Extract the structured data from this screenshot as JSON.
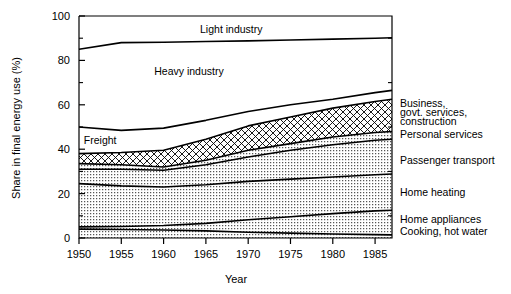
{
  "chart_data": {
    "type": "area",
    "title": "",
    "xlabel": "Year",
    "ylabel": "Share in final energy use (%)",
    "xlim": [
      1950,
      1987
    ],
    "ylim": [
      0,
      100
    ],
    "grid": false,
    "legend_position": "inline-right",
    "stacked": true,
    "x": [
      1950,
      1955,
      1960,
      1965,
      1970,
      1975,
      1980,
      1985,
      1987
    ],
    "xticks": [
      1950,
      1955,
      1960,
      1965,
      1970,
      1975,
      1980,
      1985
    ],
    "xticklabels": [
      "1950",
      "1955",
      "1960",
      "1965",
      "1970",
      "1975",
      "1980",
      "1985"
    ],
    "yticks": [
      0,
      20,
      40,
      60,
      80,
      100
    ],
    "yticklabels": [
      "0",
      "20",
      "40",
      "60",
      "80",
      "100"
    ],
    "yminorticks": [
      10,
      30,
      50,
      70,
      90
    ],
    "series": [
      {
        "name": "Cooking, hot water",
        "fill": "dots",
        "cumulative": [
          4.0,
          3.8,
          3.6,
          3.2,
          2.6,
          2.2,
          1.8,
          1.5,
          1.4
        ]
      },
      {
        "name": "Home appliances",
        "fill": "dots",
        "cumulative": [
          5.0,
          5.2,
          5.6,
          6.6,
          8.2,
          9.6,
          11.0,
          12.2,
          12.5
        ]
      },
      {
        "name": "Home heating",
        "fill": "dots",
        "cumulative": [
          24.5,
          23.5,
          23.0,
          24.0,
          25.5,
          26.5,
          27.5,
          28.5,
          28.8
        ]
      },
      {
        "name": "Passenger transport",
        "fill": "dots",
        "cumulative": [
          31.0,
          31.0,
          30.5,
          33.0,
          36.5,
          39.5,
          42.0,
          44.0,
          44.5
        ]
      },
      {
        "name": "Personal services",
        "fill": "dots",
        "cumulative": [
          33.5,
          33.0,
          32.0,
          35.0,
          39.5,
          42.5,
          45.5,
          47.5,
          48.0
        ]
      },
      {
        "name": "Business, govt. services, construction",
        "fill": "crosshatch",
        "cumulative": [
          38.0,
          38.5,
          39.5,
          44.5,
          50.5,
          54.5,
          58.5,
          61.5,
          62.5
        ]
      },
      {
        "name": "Freight",
        "fill": "none",
        "cumulative": [
          50.0,
          48.5,
          49.5,
          53.0,
          57.0,
          60.0,
          62.5,
          65.5,
          66.5
        ]
      },
      {
        "name": "Heavy industry",
        "fill": "none",
        "cumulative": [
          85.0,
          88.0,
          88.2,
          88.5,
          88.8,
          89.2,
          89.6,
          90.0,
          90.2
        ]
      },
      {
        "name": "Light industry",
        "fill": "none",
        "cumulative": [
          100,
          100,
          100,
          100,
          100,
          100,
          100,
          100,
          100
        ]
      }
    ],
    "inline_labels": [
      {
        "text": "Light industry",
        "x": 1968,
        "y": 94
      },
      {
        "text": "Heavy industry",
        "x": 1963,
        "y": 75
      },
      {
        "text": "Freight",
        "x": 1952.5,
        "y": 44
      }
    ],
    "right_labels": [
      {
        "text": "Business,",
        "y": 60.5
      },
      {
        "text": "govt. services,",
        "y": 56.5
      },
      {
        "text": "construction",
        "y": 52.5
      },
      {
        "text": "Personal services",
        "y": 46.5
      },
      {
        "text": "Passenger transport",
        "y": 35.0
      },
      {
        "text": "Home heating",
        "y": 20.5
      },
      {
        "text": "Home appliances",
        "y": 8.5
      },
      {
        "text": "Cooking, hot water",
        "y": 3.0
      }
    ]
  },
  "colors": {
    "line": "#000000",
    "background": "#ffffff",
    "dots_fill": "#d9d9d9",
    "hatch": "#000000"
  }
}
